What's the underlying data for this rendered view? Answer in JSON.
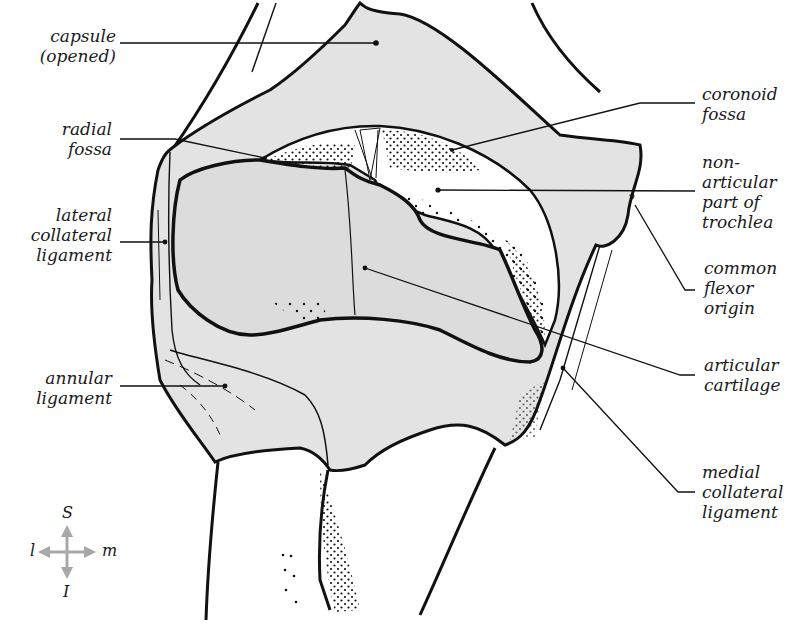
{
  "figure": {
    "colors": {
      "capsule_fill": "#e3e3e3",
      "outline": "#111111",
      "cartilage_fill": "#dcdcdc",
      "nonarticular_fill": "#ffffff",
      "compass_arrow": "#a8a8a8",
      "text": "#1a1a1a"
    }
  },
  "labels": {
    "capsule": [
      "capsule",
      "(opened)"
    ],
    "radial_fossa": [
      "radial",
      "fossa"
    ],
    "lateral_collateral_ligament": [
      "lateral",
      "collateral",
      "ligament"
    ],
    "annular_ligament": [
      "annular",
      "ligament"
    ],
    "coronoid_fossa": [
      "coronoid",
      "fossa"
    ],
    "nonarticular_trochlea": [
      "non-",
      "articular",
      "part of",
      "trochlea"
    ],
    "common_flexor_origin": [
      "common",
      "flexor",
      "origin"
    ],
    "articular_cartilage": [
      "articular",
      "cartilage"
    ],
    "medial_collateral_ligament": [
      "medial",
      "collateral",
      "ligament"
    ]
  },
  "compass": {
    "superior": "S",
    "inferior": "I",
    "lateral": "l",
    "medial": "m"
  }
}
